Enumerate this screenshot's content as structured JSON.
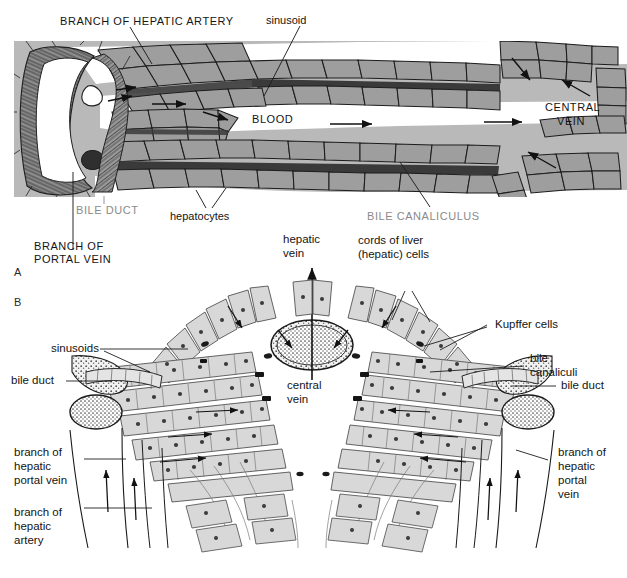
{
  "figure": {
    "panels": [
      {
        "id": "A",
        "label": "A"
      },
      {
        "id": "B",
        "label": "B"
      }
    ]
  },
  "panel_a": {
    "labels": {
      "hepatic_artery": "BRANCH OF HEPATIC ARTERY",
      "sinusoid": "sinusoid",
      "blood": "BLOOD",
      "central_vein_line1": "CENTRAL",
      "central_vein_line2": "VEIN",
      "bile_duct": "BILE DUCT",
      "hepatocytes": "hepatocytes",
      "bile_canaliculus": "BILE CANALICULUS",
      "portal_vein_line1": "BRANCH OF",
      "portal_vein_line2": "PORTAL VEIN"
    }
  },
  "panel_b": {
    "labels": {
      "hepatic_vein_line1": "hepatic",
      "hepatic_vein_line2": "vein",
      "cords_line1": "cords of liver",
      "cords_line2": "(hepatic) cells",
      "kupffer_cells": "Kupffer cells",
      "sinusoids": "sinusoids",
      "bile_duct_left": "bile duct",
      "bile_duct_right": "bile duct",
      "bile_canaliculi_line1": "bile",
      "bile_canaliculi_line2": "canaliculi",
      "central_vein_line1": "central",
      "central_vein_line2": "vein",
      "portal_vein_left_line1": "branch of",
      "portal_vein_left_line2": "hepatic",
      "portal_vein_left_line3": "portal vein",
      "hepatic_artery_left_line1": "branch of",
      "hepatic_artery_left_line2": "hepatic",
      "hepatic_artery_left_line3": "artery",
      "portal_vein_right_line1": "branch of",
      "portal_vein_right_line2": "hepatic",
      "portal_vein_right_line3": "portal",
      "portal_vein_right_line4": "vein"
    }
  },
  "colors": {
    "plate_gray": "#b9b9b9",
    "cell_fill": "#9e9e9e",
    "cell_fill_b": "#d8d8d8",
    "ink": "#1a1a1a",
    "gray_label": "#8a8a8a",
    "canaliculus": "#4a4a4a",
    "background": "#ffffff"
  }
}
